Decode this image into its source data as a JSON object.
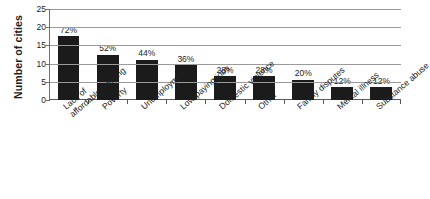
{
  "chart_data": {
    "type": "bar",
    "title": "",
    "subtitle": "",
    "xlabel": "",
    "ylabel": "Number of cities",
    "ylim": [
      0,
      25
    ],
    "ytick_values": [
      25,
      20,
      15,
      10,
      5,
      0
    ],
    "ytick_labels": [
      "25",
      "20",
      "15",
      "10",
      "5",
      "0"
    ],
    "grid": true,
    "legend": null,
    "orientation": "vertical",
    "bar_color": "#1b1b1b",
    "gridline_color": "#9a9a9a",
    "categories": [
      "Lack of affordable housing",
      "Poverty",
      "Unemployment",
      "Low-paying jobs",
      "Domestic violence",
      "Other",
      "Family disputes",
      "Mental illness",
      "Substance abuse"
    ],
    "category_lines": [
      [
        "Lack of",
        "affordable housing"
      ],
      [
        "Poverty",
        ""
      ],
      [
        "Unemployment",
        ""
      ],
      [
        "Low-paying jobs",
        ""
      ],
      [
        "Domestic violence",
        ""
      ],
      [
        "Other",
        ""
      ],
      [
        "Family disputes",
        ""
      ],
      [
        "Mental illness",
        ""
      ],
      [
        "Substance abuse",
        ""
      ]
    ],
    "values": [
      17.5,
      12.5,
      11,
      9.5,
      6.5,
      6.5,
      5.5,
      3.5,
      3.5
    ],
    "data_labels": [
      "72%",
      "52%",
      "44%",
      "36%",
      "28%",
      "28%",
      "20%",
      "12%",
      "12%"
    ],
    "percent_values": [
      72,
      52,
      44,
      36,
      28,
      28,
      20,
      12,
      12
    ]
  }
}
